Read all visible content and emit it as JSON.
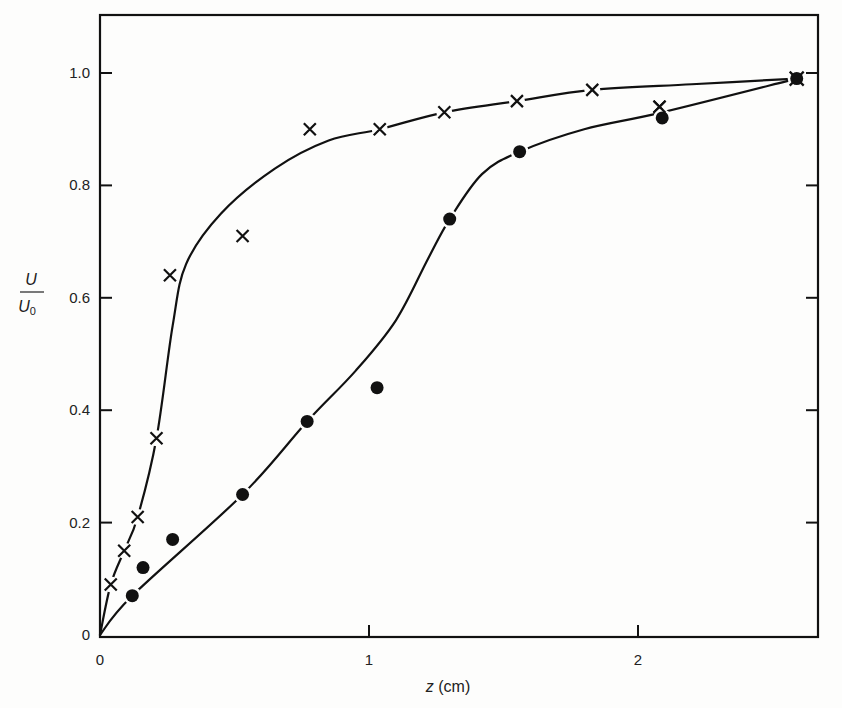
{
  "chart_data": {
    "type": "scatter",
    "title": "",
    "xlabel": "z (cm)",
    "ylabel_numerator": "U",
    "ylabel_denominator": "U0",
    "ylabel": "U/U0",
    "xlim": [
      0,
      2.62
    ],
    "ylim": [
      0,
      1.1
    ],
    "x_ticks": [
      {
        "v": 0,
        "label": "0"
      },
      {
        "v": 1,
        "label": "1"
      },
      {
        "v": 2,
        "label": "2"
      }
    ],
    "y_ticks": [
      {
        "v": 0,
        "label": "0"
      },
      {
        "v": 0.2,
        "label": "0.2"
      },
      {
        "v": 0.4,
        "label": "0.4"
      },
      {
        "v": 0.6,
        "label": "0.6"
      },
      {
        "v": 0.8,
        "label": "0.8"
      },
      {
        "v": 1.0,
        "label": "1.0"
      }
    ],
    "grid": false,
    "legend": null,
    "series": [
      {
        "name": "crosses",
        "marker": "x",
        "points": [
          [
            0.04,
            0.09
          ],
          [
            0.09,
            0.15
          ],
          [
            0.14,
            0.21
          ],
          [
            0.21,
            0.35
          ],
          [
            0.26,
            0.64
          ],
          [
            0.53,
            0.71
          ],
          [
            0.78,
            0.9
          ],
          [
            1.04,
            0.9
          ],
          [
            1.28,
            0.93
          ],
          [
            1.55,
            0.95
          ],
          [
            1.83,
            0.97
          ],
          [
            2.08,
            0.94
          ],
          [
            2.59,
            0.99
          ]
        ],
        "curve": [
          [
            0,
            0
          ],
          [
            0.04,
            0.09
          ],
          [
            0.09,
            0.15
          ],
          [
            0.14,
            0.21
          ],
          [
            0.21,
            0.35
          ],
          [
            0.27,
            0.55
          ],
          [
            0.32,
            0.66
          ],
          [
            0.45,
            0.75
          ],
          [
            0.65,
            0.83
          ],
          [
            0.85,
            0.88
          ],
          [
            1.04,
            0.9
          ],
          [
            1.28,
            0.93
          ],
          [
            1.55,
            0.95
          ],
          [
            1.83,
            0.97
          ],
          [
            2.2,
            0.98
          ],
          [
            2.59,
            0.99
          ]
        ]
      },
      {
        "name": "dots",
        "marker": "filled-circle",
        "points": [
          [
            0.12,
            0.07
          ],
          [
            0.16,
            0.12
          ],
          [
            0.27,
            0.17
          ],
          [
            0.53,
            0.25
          ],
          [
            0.77,
            0.38
          ],
          [
            1.03,
            0.44
          ],
          [
            1.3,
            0.74
          ],
          [
            1.56,
            0.86
          ],
          [
            2.09,
            0.92
          ],
          [
            2.59,
            0.99
          ]
        ],
        "curve": [
          [
            0,
            0
          ],
          [
            0.12,
            0.07
          ],
          [
            0.53,
            0.25
          ],
          [
            0.77,
            0.38
          ],
          [
            0.95,
            0.47
          ],
          [
            1.1,
            0.56
          ],
          [
            1.22,
            0.67
          ],
          [
            1.3,
            0.74
          ],
          [
            1.42,
            0.82
          ],
          [
            1.56,
            0.86
          ],
          [
            1.8,
            0.9
          ],
          [
            2.09,
            0.93
          ],
          [
            2.59,
            0.99
          ]
        ]
      }
    ]
  },
  "axes": {
    "x_title_italic": "z",
    "x_title_unit": "(cm)"
  },
  "colors": {
    "ink": "#111111",
    "background": "#fdfdfc"
  }
}
